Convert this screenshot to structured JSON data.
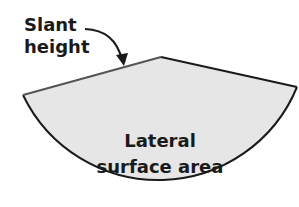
{
  "diagram": {
    "slant_label_line1": "Slant",
    "slant_label_line2": "height",
    "center_label_line1": "Lateral",
    "center_label_line2": "surface area"
  },
  "colors": {
    "fill": "#e6e6e6",
    "outline": "#1a1a1a",
    "slant_edge": "#555555",
    "text": "#1a1a1a"
  }
}
